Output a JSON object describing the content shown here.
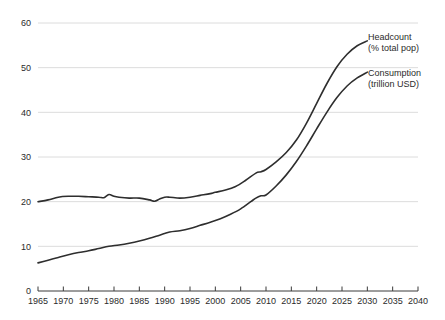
{
  "chart_data": {
    "type": "line",
    "title": "",
    "subtitle": "",
    "xlabel": "",
    "ylabel": "",
    "xlim": [
      1965,
      2040
    ],
    "ylim": [
      0,
      60
    ],
    "grid": true,
    "legend_position": "right-inline-annotations",
    "x_ticks": [
      1965,
      1970,
      1975,
      1980,
      1985,
      1990,
      1995,
      2000,
      2005,
      2010,
      2015,
      2020,
      2025,
      2030,
      2035,
      2040
    ],
    "y_ticks": [
      0,
      10,
      20,
      30,
      40,
      50,
      60
    ],
    "line_color": "#2e2e2e",
    "grid_color": "#dcdcdc",
    "axis_color": "#3a3a3a",
    "background_color": "#ffffff",
    "series": [
      {
        "name": "Headcount",
        "label_line1": "Headcount",
        "label_line2": "(% total pop)",
        "unit": "% total pop",
        "x": [
          1965,
          1967,
          1969,
          1971,
          1973,
          1975,
          1977,
          1978,
          1979,
          1980,
          1981,
          1983,
          1985,
          1987,
          1988,
          1989,
          1990,
          1991,
          1993,
          1995,
          1997,
          1999,
          2000,
          2002,
          2004,
          2006,
          2008,
          2009,
          2010,
          2012,
          2014,
          2016,
          2018,
          2020,
          2022,
          2024,
          2026,
          2028,
          2030
        ],
        "values": [
          20.0,
          20.4,
          21.0,
          21.2,
          21.2,
          21.1,
          21.0,
          20.9,
          21.6,
          21.2,
          21.0,
          20.8,
          20.8,
          20.4,
          20.1,
          20.6,
          21.0,
          21.0,
          20.8,
          21.0,
          21.4,
          21.8,
          22.1,
          22.6,
          23.4,
          24.8,
          26.4,
          26.7,
          27.2,
          28.9,
          31.0,
          33.8,
          37.6,
          42.0,
          46.4,
          50.2,
          53.0,
          54.9,
          56.0
        ]
      },
      {
        "name": "Consumption",
        "label_line1": "Consumption",
        "label_line2": "(trillion USD)",
        "unit": "trillion USD",
        "x": [
          1965,
          1967,
          1969,
          1971,
          1973,
          1975,
          1977,
          1979,
          1981,
          1983,
          1985,
          1987,
          1989,
          1991,
          1993,
          1995,
          1997,
          1999,
          2001,
          2003,
          2005,
          2007,
          2008,
          2009,
          2010,
          2012,
          2014,
          2016,
          2018,
          2020,
          2022,
          2024,
          2026,
          2028,
          2030
        ],
        "values": [
          6.3,
          6.9,
          7.5,
          8.1,
          8.6,
          9.0,
          9.5,
          10.0,
          10.3,
          10.7,
          11.2,
          11.8,
          12.5,
          13.2,
          13.5,
          14.0,
          14.7,
          15.4,
          16.2,
          17.2,
          18.4,
          20.0,
          20.8,
          21.3,
          21.5,
          23.5,
          26.0,
          29.0,
          32.5,
          36.3,
          40.0,
          43.3,
          45.9,
          47.7,
          49.0
        ]
      }
    ]
  },
  "annotations": {
    "headcount": {
      "line1": "Headcount",
      "line2": "(% total pop)"
    },
    "consumption": {
      "line1": "Consumption",
      "line2": "(trillion USD)"
    }
  }
}
